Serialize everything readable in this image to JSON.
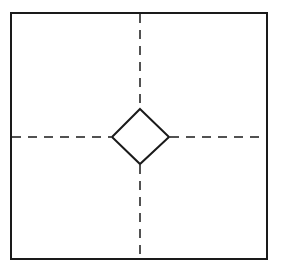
{
  "diagram": {
    "colors": {
      "stroke": "#1a1a1a",
      "background": "#ffffff"
    },
    "frame": {
      "x": 11,
      "y": 13,
      "width": 256,
      "height": 246
    },
    "center": {
      "x": 140,
      "y": 137
    },
    "diamond": {
      "half_width": 28,
      "half_height": 27
    },
    "dash_pattern": "9 7"
  }
}
